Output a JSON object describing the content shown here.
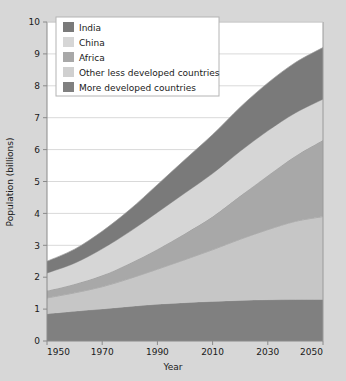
{
  "chart_data": {
    "type": "area",
    "stacked": true,
    "title": "",
    "xlabel": "Year",
    "ylabel": "Population (billions)",
    "xlim": [
      1950,
      2050
    ],
    "ylim": [
      0,
      10
    ],
    "grid": true,
    "grid_axis": "y",
    "legend_position": "top-left",
    "x": [
      1950,
      1960,
      1970,
      1980,
      1990,
      2000,
      2010,
      2020,
      2030,
      2040,
      2050
    ],
    "xticks": [
      "1950",
      "1970",
      "1990",
      "2010",
      "2030",
      "2050"
    ],
    "xtick_values": [
      1950,
      1970,
      1990,
      2010,
      2030,
      2050
    ],
    "yticks": [
      "0",
      "1",
      "2",
      "3",
      "4",
      "5",
      "6",
      "7",
      "8",
      "9",
      "10"
    ],
    "ytick_values": [
      0,
      1,
      2,
      3,
      4,
      5,
      6,
      7,
      8,
      9,
      10
    ],
    "stack_order_bottom_to_top": [
      "More developed countries",
      "Other less developed countries",
      "Africa",
      "China",
      "India"
    ],
    "series": [
      {
        "name": "More developed countries",
        "color": "#808080",
        "values": [
          0.85,
          0.93,
          1.0,
          1.08,
          1.15,
          1.2,
          1.24,
          1.27,
          1.29,
          1.3,
          1.3
        ]
      },
      {
        "name": "Other less developed countries",
        "color": "#c6c6c6",
        "values": [
          0.5,
          0.58,
          0.7,
          0.88,
          1.1,
          1.35,
          1.62,
          1.92,
          2.2,
          2.45,
          2.6
        ]
      },
      {
        "name": "Africa",
        "color": "#a8a8a8",
        "values": [
          0.23,
          0.28,
          0.36,
          0.48,
          0.63,
          0.82,
          1.04,
          1.36,
          1.7,
          2.05,
          2.4
        ]
      },
      {
        "name": "China",
        "color": "#d6d6d6",
        "values": [
          0.55,
          0.65,
          0.83,
          0.99,
          1.15,
          1.27,
          1.35,
          1.4,
          1.4,
          1.35,
          1.28
        ]
      },
      {
        "name": "India",
        "color": "#7a7a7a",
        "values": [
          0.37,
          0.44,
          0.55,
          0.69,
          0.87,
          1.05,
          1.22,
          1.38,
          1.5,
          1.58,
          1.62
        ]
      }
    ],
    "cumulative_totals": [
      2.5,
      2.88,
      3.44,
      4.12,
      4.9,
      5.69,
      6.47,
      7.33,
      8.09,
      8.73,
      9.2
    ]
  },
  "legend": {
    "items": [
      {
        "label": "India",
        "color": "#7a7a7a"
      },
      {
        "label": "China",
        "color": "#d6d6d6"
      },
      {
        "label": "Africa",
        "color": "#a8a8a8"
      },
      {
        "label": "Other less developed countries",
        "color": "#d0d0d0"
      },
      {
        "label": "More developed countries",
        "color": "#808080"
      }
    ]
  },
  "axes": {
    "y_title": "Population (billions)",
    "x_title": "Year"
  },
  "style": {
    "figure_background": "#d7d7d7",
    "plot_background": "#ffffff",
    "grid_color": "#d9d9d9",
    "axis_color": "#8a8a8a",
    "text_color": "#1a1a1a",
    "legend_background": "#ffffff",
    "legend_border": "#b4b4b4"
  }
}
